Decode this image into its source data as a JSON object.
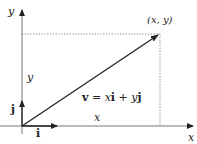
{
  "diagram": {
    "type": "vector-decomposition",
    "colors": {
      "ink": "#222222",
      "axis": "#444444",
      "dotted": "#555555",
      "background": "#ffffff"
    },
    "axes": {
      "x_label": "x",
      "y_label": "y"
    },
    "point": {
      "label": "(x, y)"
    },
    "vector": {
      "name": "v",
      "equation": "v = xi + yj",
      "eq_parts": {
        "v": "v",
        "eq": " = ",
        "x": "x",
        "i": "i",
        "plus": " + ",
        "y": "y",
        "j": "j"
      }
    },
    "components": {
      "x_label": "x",
      "y_label": "y"
    },
    "unit_vectors": {
      "i_label": "i",
      "j_label": "j"
    }
  }
}
